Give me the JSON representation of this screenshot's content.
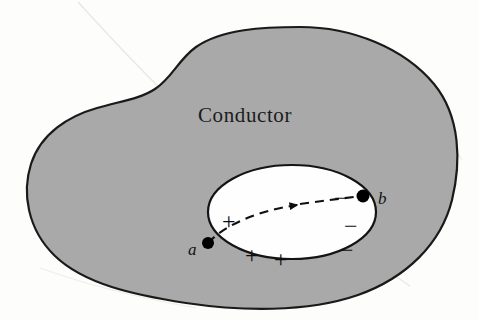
{
  "figure": {
    "domain": "diagram",
    "title_label": "Conductor",
    "background_color": "#fdfdfc",
    "conductor": {
      "name": "conductor-body",
      "fill_color": "#a9a9a9",
      "outline_color": "#1a1a1a",
      "outline_width": 2.2
    },
    "cavity": {
      "name": "cavity",
      "fill_color": "#fefefe",
      "outline_color": "#141414",
      "outline_width": 2.2,
      "center_x": 292,
      "center_y": 212,
      "radius_x": 84,
      "radius_y": 47
    },
    "points": [
      {
        "id": "a",
        "label": "a",
        "x": 208,
        "y": 243,
        "dot_radius": 6,
        "label_x": 188,
        "label_y": 241,
        "color": "#000000"
      },
      {
        "id": "b",
        "label": "b",
        "x": 363,
        "y": 196,
        "dot_radius": 6.5,
        "label_x": 378,
        "label_y": 190,
        "color": "#000000"
      }
    ],
    "path": {
      "name": "charge-path",
      "style": "dashed",
      "dash_pattern": "9 6",
      "stroke_color": "#101010",
      "stroke_width": 2.1,
      "from_point": "a",
      "to_point": "b",
      "arrow_x": 297,
      "arrow_y": 205,
      "arrow_direction": "a-to-b"
    },
    "positive_charges": [
      {
        "symbol": "+",
        "x": 222,
        "y": 209
      },
      {
        "symbol": "+",
        "x": 245,
        "y": 243
      },
      {
        "symbol": "+",
        "x": 274,
        "y": 247
      }
    ],
    "negative_charges": [
      {
        "symbol": "−",
        "x": 334,
        "y": 186
      },
      {
        "symbol": "−",
        "x": 344,
        "y": 214
      },
      {
        "symbol": "−",
        "x": 340,
        "y": 238
      }
    ],
    "scan_artifact": {
      "name": "page-crease",
      "visible": true,
      "color": "#d9d4cc"
    },
    "conductor_label_position": {
      "x": 198,
      "y": 105
    }
  }
}
